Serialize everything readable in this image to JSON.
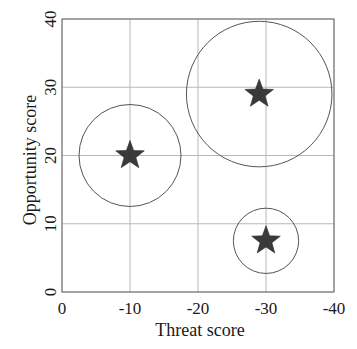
{
  "chart_data": {
    "type": "scatter",
    "title": "",
    "xlabel": "Threat score",
    "ylabel": "Opportunity score",
    "xlim": [
      0,
      -40
    ],
    "ylim": [
      0,
      40
    ],
    "xticks": [
      0,
      -10,
      -20,
      -30,
      -40
    ],
    "yticks": [
      0,
      10,
      20,
      30,
      40
    ],
    "xtick_labels": [
      "0",
      "-10",
      "-20",
      "-30",
      "-40"
    ],
    "ytick_labels": [
      "0",
      "10",
      "20",
      "30",
      "40"
    ],
    "grid": true,
    "legend": null,
    "marker": "star",
    "points": [
      {
        "label": "1",
        "x": -10,
        "y": 20,
        "radius": 7.5
      },
      {
        "label": "2",
        "x": -30,
        "y": 7.5,
        "radius": 4.8
      },
      {
        "label": "3",
        "x": -29,
        "y": 29,
        "radius": 10.7
      }
    ]
  },
  "colors": {
    "star_fill": "#3a3a3a",
    "circle_stroke": "#555555",
    "grid": "#b8b8b8",
    "axis": "#6a6a6a",
    "text": "#1a1a1a"
  }
}
